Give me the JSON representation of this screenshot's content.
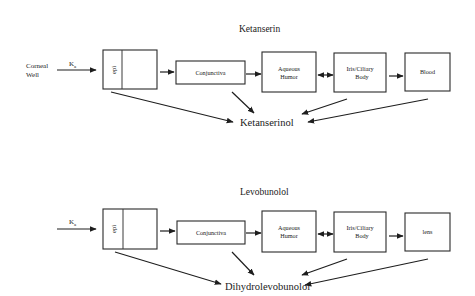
{
  "panels": [
    {
      "title": "Ketanserin",
      "source_label_line1": "Corneal",
      "source_label_line2": "Well",
      "rate_label": "K",
      "rate_subscript": "a",
      "compartments": {
        "epi": "epi",
        "conjunctiva": "Conjunctiva",
        "aqueous_line1": "Aqueous",
        "aqueous_line2": "Humor",
        "iris_line1": "Iris/Ciliary",
        "iris_line2": "Body",
        "final": "Blood"
      },
      "metabolite": "Ketanserinol"
    },
    {
      "title": "Levobunolol",
      "source_label_line1": "",
      "source_label_line2": "",
      "rate_label": "K",
      "rate_subscript": "a",
      "compartments": {
        "epi": "epi",
        "conjunctiva": "Conjunctiva",
        "aqueous_line1": "Aqueous",
        "aqueous_line2": "Humor",
        "iris_line1": "Iris/Ciliary",
        "iris_line2": "Body",
        "final": "lens"
      },
      "metabolite": "Dihydrolevobunolol"
    }
  ],
  "colors": {
    "line": "#1e1e1e",
    "background": "#ffffff"
  }
}
